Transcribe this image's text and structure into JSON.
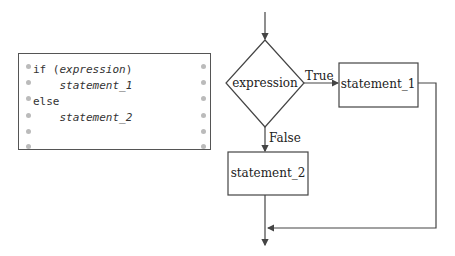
{
  "code_panel": {
    "lines": [
      {
        "keyword": "if (",
        "italic": "expression",
        "suffix": ")"
      },
      {
        "keyword": "    ",
        "italic": "statement_1",
        "suffix": ""
      },
      {
        "keyword": "else",
        "italic": "",
        "suffix": ""
      },
      {
        "keyword": "    ",
        "italic": "statement_2",
        "suffix": ""
      }
    ]
  },
  "flowchart": {
    "decision_label": "expression",
    "true_label": "True",
    "false_label": "False",
    "statement_1": "statement_1",
    "statement_2": "statement_2"
  },
  "colors": {
    "line": "#444444",
    "dot": "#bbbbbb"
  }
}
